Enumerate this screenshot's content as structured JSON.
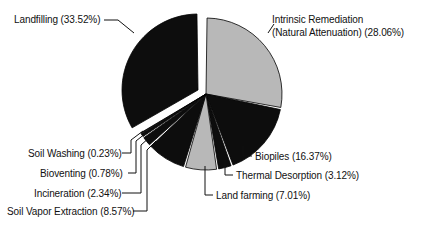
{
  "chart_data": {
    "type": "pie",
    "title": "",
    "subtitle": "",
    "xlabel": "",
    "ylabel": "",
    "legend_position": "none",
    "grid": false,
    "units": "percent",
    "start_angle_deg": 0,
    "direction": "clockwise",
    "categories": [
      "Intrinsic Remediation (Natural Attenuation)",
      "Biopiles",
      "Thermal Desorption",
      "Land farming",
      "Soil Vapor Extraction",
      "Incineration",
      "Bioventing",
      "Soil Washing",
      "Landfilling"
    ],
    "values": [
      28.06,
      16.37,
      3.12,
      7.01,
      8.57,
      2.34,
      0.78,
      0.23,
      33.52
    ],
    "slices": [
      {
        "name": "Intrinsic Remediation (Natural Attenuation)",
        "value": 28.06,
        "value_text": "28.06%",
        "color": "#b8b8b8",
        "exploded": false,
        "label_line1": "Intrinsic Remediation",
        "label_line2": "(Natural Attenuation) (28.06%)"
      },
      {
        "name": "Biopiles",
        "value": 16.37,
        "value_text": "16.37%",
        "color": "#0d0d0d",
        "exploded": false,
        "label_line1": "Biopiles (16.37%)",
        "label_line2": ""
      },
      {
        "name": "Thermal Desorption",
        "value": 3.12,
        "value_text": "3.12%",
        "color": "#0d0d0d",
        "exploded": false,
        "label_line1": "Thermal Desorption (3.12%)",
        "label_line2": ""
      },
      {
        "name": "Land farming",
        "value": 7.01,
        "value_text": "7.01%",
        "color": "#b8b8b8",
        "exploded": false,
        "label_line1": "Land farming (7.01%)",
        "label_line2": ""
      },
      {
        "name": "Soil Vapor Extraction",
        "value": 8.57,
        "value_text": "8.57%",
        "color": "#0d0d0d",
        "exploded": false,
        "label_line1": "Soil Vapor Extraction (8.57%)",
        "label_line2": ""
      },
      {
        "name": "Incineration",
        "value": 2.34,
        "value_text": "2.34%",
        "color": "#0d0d0d",
        "exploded": false,
        "label_line1": "Incineration (2.34%)",
        "label_line2": ""
      },
      {
        "name": "Bioventing",
        "value": 0.78,
        "value_text": "0.78%",
        "color": "#0d0d0d",
        "exploded": false,
        "label_line1": "Bioventing (0.78%)",
        "label_line2": ""
      },
      {
        "name": "Soil Washing",
        "value": 0.23,
        "value_text": "0.23%",
        "color": "#0d0d0d",
        "exploded": false,
        "label_line1": "Soil Washing (0.23%)",
        "label_line2": ""
      },
      {
        "name": "Landfilling",
        "value": 33.52,
        "value_text": "33.52%",
        "color": "#0d0d0d",
        "exploded": true,
        "label_line1": "Landfilling (33.52%)",
        "label_line2": ""
      }
    ]
  },
  "geometry": {
    "center_x": 206,
    "center_y": 94,
    "radius": 76,
    "explode_distance": 9,
    "explode_dx": -8,
    "explode_dy": -4,
    "gap_deg": 1.6,
    "stroke": "#000000",
    "stroke_width": 0.8,
    "background": "#ffffff"
  },
  "labels": {
    "landfilling": {
      "text_line1": "Landfilling (33.52%)",
      "left": 14,
      "top": 14
    },
    "intrinsic": {
      "text_line1": "Intrinsic Remediation",
      "text_line2": "(Natural Attenuation) (28.06%)",
      "left": 272,
      "top": 14
    },
    "biopiles": {
      "text_line1": "Biopiles (16.37%)",
      "left": 255,
      "top": 151
    },
    "thermal_desorption": {
      "text_line1": "Thermal Desorption (3.12%)",
      "left": 236,
      "top": 170
    },
    "land_farming": {
      "text_line1": "Land farming (7.01%)",
      "left": 216,
      "top": 190
    },
    "soil_washing": {
      "text_line1": "Soil Washing (0.23%)",
      "left": 28,
      "top": 148
    },
    "bioventing": {
      "text_line1": "Bioventing (0.78%)",
      "left": 40,
      "top": 168
    },
    "incineration": {
      "text_line1": "Incineration (2.34%)",
      "left": 34,
      "top": 188
    },
    "soil_vapor_extraction": {
      "text_line1": "Soil Vapor Extraction (8.57%)",
      "left": 7,
      "top": 206
    }
  }
}
